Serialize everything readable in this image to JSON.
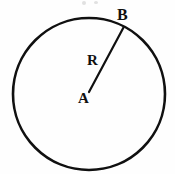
{
  "figure": {
    "kind": "geometry-diagram",
    "background_color": "#fefefe",
    "stroke_color": "#101010",
    "canvas": {
      "width": 175,
      "height": 174
    }
  },
  "circle": {
    "name": "circle-outline",
    "center_x": 89,
    "center_y": 94,
    "radius": 76,
    "stroke_width": 2.6,
    "stroke_color": "#101010",
    "fill": "none"
  },
  "radius_segment": {
    "name": "radius-line",
    "from_x": 89,
    "from_y": 92,
    "to_x": 123.5,
    "to_y": 27.5,
    "stroke_width": 2.2,
    "stroke_color": "#101010"
  },
  "labels": {
    "center_point": "A",
    "circumference_point": "B",
    "radius": "R"
  },
  "artifacts": {
    "present": true,
    "count": 2,
    "color": "#c9c9c9"
  }
}
